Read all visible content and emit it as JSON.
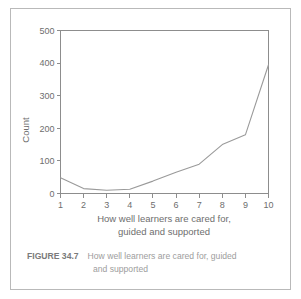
{
  "figure": {
    "label": "FIGURE 34.7",
    "caption_line_1": "How well learners are cared for, guided",
    "caption_line_2": "and supported"
  },
  "axis": {
    "y_title": "Count",
    "x_title_line_1": "How well learners are cared for,",
    "x_title_line_2": "guided and supported",
    "y_ticks": [
      "0",
      "100",
      "200",
      "300",
      "400",
      "500"
    ],
    "x_ticks": [
      "1",
      "2",
      "3",
      "4",
      "5",
      "6",
      "7",
      "8",
      "9",
      "10"
    ]
  },
  "colors": {
    "line": "#9a9a9a",
    "axis": "#8d8d8d",
    "border": "#b9b9b9",
    "tick_text": "#6e6e6e",
    "caption_text": "#9d9d9d",
    "caption_label": "#7a7a7a"
  },
  "chart_data": {
    "type": "line",
    "title": "",
    "subtitle": "",
    "xlabel": "How well learners are cared for, guided and supported",
    "ylabel": "Count",
    "categories": [
      1,
      2,
      3,
      4,
      5,
      6,
      7,
      8,
      9,
      10
    ],
    "values": [
      48,
      15,
      10,
      13,
      38,
      65,
      90,
      150,
      180,
      395
    ],
    "series": [
      {
        "name": "Count",
        "values": [
          48,
          15,
          10,
          13,
          38,
          65,
          90,
          150,
          180,
          395
        ]
      }
    ],
    "xlim": [
      1,
      10
    ],
    "ylim": [
      0,
      500
    ],
    "y_tick_values": [
      0,
      100,
      200,
      300,
      400,
      500
    ],
    "x_tick_values": [
      1,
      2,
      3,
      4,
      5,
      6,
      7,
      8,
      9,
      10
    ],
    "grid": false,
    "legend": false,
    "legend_position": "none"
  }
}
